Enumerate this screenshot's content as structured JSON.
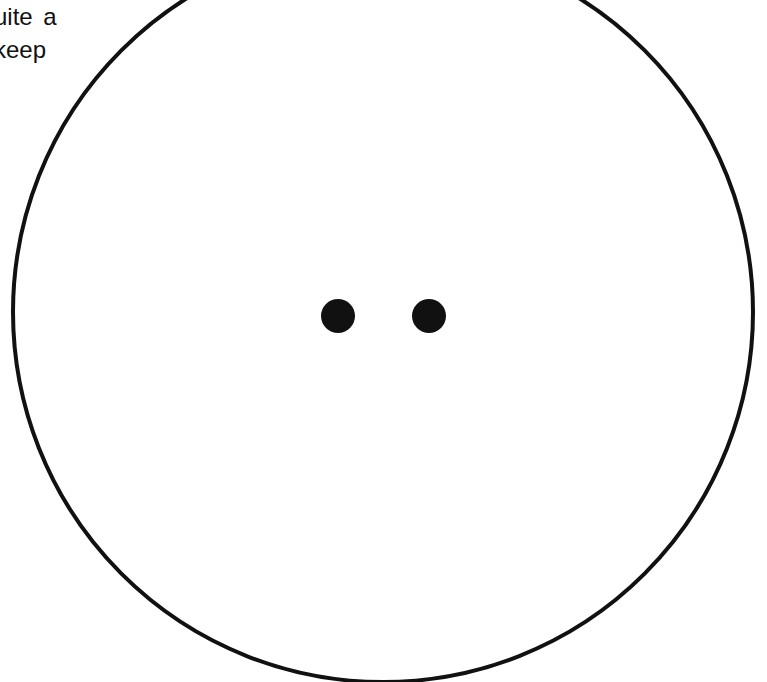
{
  "text_fragment": {
    "lines": [
      "uite a",
      "keep"
    ]
  },
  "figure": {
    "shape": "circle-with-two-dots",
    "circle": {
      "cx": 383,
      "cy": 312,
      "r": 370,
      "stroke": "#111111",
      "stroke_width": 4
    },
    "dots": [
      {
        "cx": 338,
        "cy": 316,
        "r": 17,
        "fill": "#111111"
      },
      {
        "cx": 429,
        "cy": 316,
        "r": 17,
        "fill": "#111111"
      }
    ]
  }
}
